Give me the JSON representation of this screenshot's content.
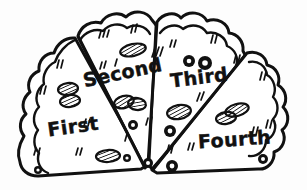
{
  "illustration": {
    "title": "Pizza cut into four labeled slices",
    "style": "black-and-white hand-drawn cartoon line art",
    "background_color": "#fdfdfd",
    "ink_color": "#111111",
    "fill_color": "#ffffff"
  },
  "pizza": {
    "crust_name": "bumpy scalloped crust",
    "slice_count": 4,
    "slices": [
      {
        "id": "first",
        "label": "First",
        "label_x": 74,
        "label_y": 133,
        "label_size": 19,
        "label_rotation": -8,
        "position": "far-left"
      },
      {
        "id": "second",
        "label": "Second",
        "label_x": 124,
        "label_y": 79,
        "label_size": 19,
        "label_rotation": -12,
        "position": "left-center"
      },
      {
        "id": "third",
        "label": "Third",
        "label_x": 200,
        "label_y": 84,
        "label_size": 19,
        "label_rotation": -7,
        "position": "right-center"
      },
      {
        "id": "fourth",
        "label": "Fourth",
        "label_x": 235,
        "label_y": 146,
        "label_size": 19,
        "label_rotation": -4,
        "position": "far-right"
      }
    ]
  },
  "toppings": {
    "hatched_ovals": [
      {
        "cx": 133,
        "cy": 50,
        "rx": 13,
        "ry": 6,
        "rot": -12
      },
      {
        "cx": 68,
        "cy": 89,
        "rx": 10,
        "ry": 6,
        "rot": -6
      },
      {
        "cx": 70,
        "cy": 101,
        "rx": 10,
        "ry": 6,
        "rot": -6
      },
      {
        "cx": 124,
        "cy": 102,
        "rx": 10,
        "ry": 6,
        "rot": -14
      },
      {
        "cx": 137,
        "cy": 104,
        "rx": 9,
        "ry": 6,
        "rot": 8
      },
      {
        "cx": 179,
        "cy": 112,
        "rx": 12,
        "ry": 7,
        "rot": -10
      },
      {
        "cx": 237,
        "cy": 110,
        "rx": 12,
        "ry": 6,
        "rot": -16
      },
      {
        "cx": 226,
        "cy": 118,
        "rx": 10,
        "ry": 6,
        "rot": -8
      },
      {
        "cx": 108,
        "cy": 156,
        "rx": 12,
        "ry": 6,
        "rot": -3
      }
    ],
    "olive_rings": [
      {
        "cx": 189,
        "cy": 61,
        "r": 6
      },
      {
        "cx": 205,
        "cy": 63,
        "r": 7
      },
      {
        "cx": 133,
        "cy": 125,
        "r": 5
      },
      {
        "cx": 170,
        "cy": 131,
        "r": 6
      },
      {
        "cx": 148,
        "cy": 163,
        "r": 5
      },
      {
        "cx": 172,
        "cy": 166,
        "r": 6
      },
      {
        "cx": 263,
        "cy": 159,
        "r": 5
      },
      {
        "cx": 38,
        "cy": 170,
        "r": 4
      },
      {
        "cx": 127,
        "cy": 158,
        "r": 4
      }
    ]
  }
}
